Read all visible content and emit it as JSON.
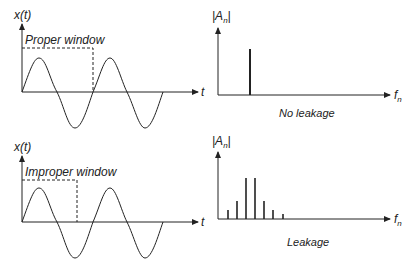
{
  "top": {
    "time_axis_y": "x(t)",
    "time_axis_x": "t",
    "window_label": "Proper window",
    "spec_axis_y": "|A",
    "spec_axis_y_sub": "n",
    "spec_axis_x": "f",
    "spec_axis_x_sub": "n",
    "caption": "No leakage"
  },
  "bottom": {
    "time_axis_y": "x(t)",
    "time_axis_x": "t",
    "window_label": "Improper window",
    "spec_axis_y": "|A",
    "spec_axis_y_sub": "n",
    "spec_axis_x": "f",
    "spec_axis_x_sub": "n",
    "caption": "Leakage"
  },
  "colors": {
    "stroke": "#222222"
  }
}
